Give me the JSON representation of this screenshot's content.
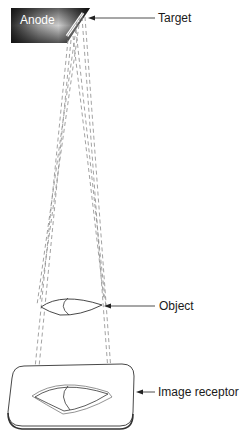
{
  "figure": {
    "labels": {
      "anode": "Anode",
      "target": "Target",
      "object": "Object",
      "image_receptor": "Image receptor"
    },
    "components": [
      {
        "id": "anode",
        "label": "Anode",
        "shape": "beveled-block",
        "fill": "gradient-dark-gray"
      },
      {
        "id": "target",
        "label": "Target",
        "shape": "angled-strip-on-anode-face"
      },
      {
        "id": "object",
        "label": "Object",
        "shape": "lens/teardrop outline"
      },
      {
        "id": "image-receptor",
        "label": "Image receptor",
        "shape": "rounded rectangular plate in perspective"
      }
    ],
    "beam_lines": {
      "style": "dashed",
      "description": "Diverging x-ray beam lines from the target through the object edges to the image receptor, forming a magnified projected image"
    },
    "colors": {
      "anode_dark": "#1a1a1a",
      "anode_light": "#cfcfcf",
      "beam": "#8a8a8a",
      "line": "#222222"
    }
  }
}
